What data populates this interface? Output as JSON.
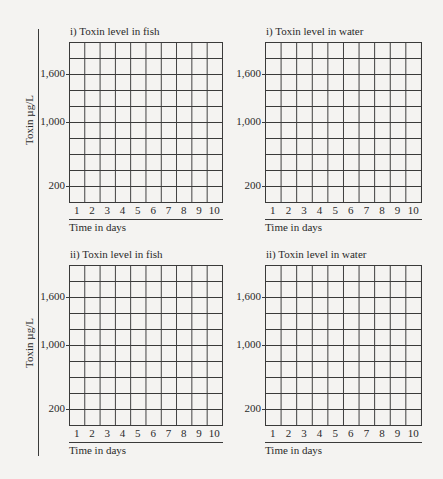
{
  "y_axis_label": "Toxin µg/L",
  "x_axis_label": "Time in days",
  "panels": [
    {
      "title": "i) Toxin level in fish"
    },
    {
      "title": "i) Toxin level in water"
    },
    {
      "title": "ii) Toxin level in fish"
    },
    {
      "title": "ii) Toxin level in water"
    }
  ],
  "y_ticks": [
    "1,600",
    "1,000",
    "200"
  ],
  "x_ticks": [
    "1",
    "2",
    "3",
    "4",
    "5",
    "6",
    "7",
    "8",
    "9",
    "10"
  ],
  "chart_data": [
    {
      "type": "line",
      "title": "i) Toxin level in fish",
      "xlabel": "Time in days",
      "ylabel": "Toxin µg/L",
      "x": [
        1,
        2,
        3,
        4,
        5,
        6,
        7,
        8,
        9,
        10
      ],
      "y_tick_labels": [
        "1,600",
        "1,000",
        "200"
      ],
      "grid": true,
      "series": [],
      "note": "blank grid, 10 columns x 10 rows"
    },
    {
      "type": "line",
      "title": "i) Toxin level in water",
      "xlabel": "Time in days",
      "ylabel": "Toxin µg/L",
      "x": [
        1,
        2,
        3,
        4,
        5,
        6,
        7,
        8,
        9,
        10
      ],
      "y_tick_labels": [
        "1,600",
        "1,000",
        "200"
      ],
      "grid": true,
      "series": [],
      "note": "blank grid, 10 columns x 10 rows"
    },
    {
      "type": "line",
      "title": "ii) Toxin level in fish",
      "xlabel": "Time in days",
      "ylabel": "Toxin µg/L",
      "x": [
        1,
        2,
        3,
        4,
        5,
        6,
        7,
        8,
        9,
        10
      ],
      "y_tick_labels": [
        "1,600",
        "1,000",
        "200"
      ],
      "grid": true,
      "series": [],
      "note": "blank grid, 10 columns x 10 rows"
    },
    {
      "type": "line",
      "title": "ii) Toxin level in water",
      "xlabel": "Time in days",
      "ylabel": "Toxin µg/L",
      "x": [
        1,
        2,
        3,
        4,
        5,
        6,
        7,
        8,
        9,
        10
      ],
      "y_tick_labels": [
        "1,600",
        "1,000",
        "200"
      ],
      "grid": true,
      "series": [],
      "note": "blank grid, 10 columns x 10 rows"
    }
  ]
}
